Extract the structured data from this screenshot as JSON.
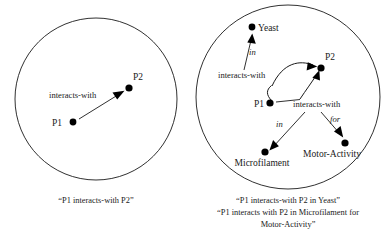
{
  "figure": {
    "stroke_color": "#1a1a1a",
    "node_color": "#000000",
    "background": "#ffffff"
  },
  "panels": [
    {
      "id": "left",
      "name": "binary-relation-panel",
      "circle": {
        "cx": 96,
        "cy": 99,
        "r": 81
      },
      "nodes": [
        {
          "id": "p1",
          "label": "P1",
          "x": 73,
          "y": 122,
          "label_x": 62,
          "label_y": 126,
          "anchor": "end"
        },
        {
          "id": "p2",
          "label": "P2",
          "x": 129,
          "y": 88,
          "label_x": 133,
          "label_y": 80,
          "anchor": "start"
        }
      ],
      "edges": [
        {
          "id": "interacts",
          "label": "interacts-with",
          "label_x": 49,
          "label_y": 98,
          "italic": false,
          "from": "p1",
          "to": "p2"
        }
      ],
      "caption": [
        "“P1 interacts-with P2”"
      ]
    },
    {
      "id": "right",
      "name": "nary-relation-panel",
      "circle": {
        "cx": 288,
        "cy": 97,
        "r": 92
      },
      "nodes": [
        {
          "id": "yeast",
          "label": "Yeast",
          "x": 252,
          "y": 27,
          "label_x": 258,
          "label_y": 31,
          "anchor": "start"
        },
        {
          "id": "p2r",
          "label": "P2",
          "x": 321,
          "y": 68,
          "label_x": 325,
          "label_y": 60,
          "anchor": "start"
        },
        {
          "id": "p1r",
          "label": "P1",
          "x": 270,
          "y": 103,
          "label_x": 264,
          "label_y": 107,
          "anchor": "end"
        },
        {
          "id": "microfilament",
          "label": "Microfilament",
          "x": 265,
          "y": 152,
          "label_x": 262,
          "label_y": 166,
          "anchor": "middle"
        },
        {
          "id": "motoractivity",
          "label": "Motor-Activity",
          "x": 345,
          "y": 143,
          "label_x": 332,
          "label_y": 157,
          "anchor": "middle"
        }
      ],
      "edges": [
        {
          "id": "interacts-upper",
          "label": "interacts-with",
          "label_x": 218,
          "label_y": 78,
          "italic": false
        },
        {
          "id": "in-yeast",
          "label": "in",
          "label_x": 249,
          "label_y": 55,
          "italic": true
        },
        {
          "id": "interacts-lower",
          "label": "interacts-with",
          "label_x": 293,
          "label_y": 107,
          "italic": false
        },
        {
          "id": "in-microfilament",
          "label": "in",
          "label_x": 276,
          "label_y": 127,
          "italic": true
        },
        {
          "id": "for-motor",
          "label": "for",
          "label_x": 330,
          "label_y": 122,
          "italic": true
        }
      ],
      "caption": [
        "“P1 interacts-with P2 in Yeast”",
        "“P1 interacts with P2 in Microfilament for",
        "Motor-Activity”"
      ]
    }
  ]
}
